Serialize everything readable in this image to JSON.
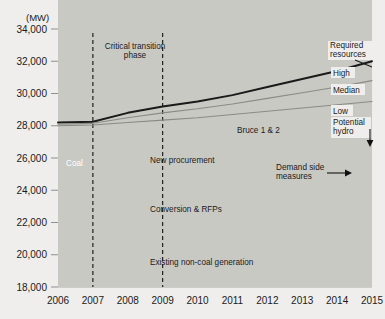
{
  "chart_data": {
    "type": "area",
    "title": "",
    "ylabel": "(MW)",
    "xlabel": "",
    "ylim": [
      18000,
      34000
    ],
    "yticks": [
      18000,
      20000,
      22000,
      24000,
      26000,
      28000,
      30000,
      32000,
      34000
    ],
    "ytick_labels": [
      "18,000",
      "20,000",
      "22,000",
      "24,000",
      "26,000",
      "28,000",
      "30,000",
      "32,000",
      "34,000"
    ],
    "grid": true,
    "legend_position": "inline-annotations",
    "x": [
      2006,
      2007,
      2008,
      2009,
      2010,
      2011,
      2012,
      2013,
      2014,
      2015
    ],
    "xtick_labels": [
      "2006",
      "2007",
      "2008",
      "2009",
      "2010",
      "2011",
      "2012",
      "2013",
      "2014",
      "2015"
    ],
    "stack_order_bottom_to_top": [
      "Existing non-coal generation",
      "Conversion & RFPs",
      "New procurement",
      "Demand side measures",
      "Bruce 1 & 2",
      "Potential hydro",
      "Coal"
    ],
    "series": [
      {
        "name": "Existing non-coal generation",
        "color": "#c9c9c4",
        "values": [
          22100,
          22100,
          22100,
          22100,
          22100,
          22100,
          22100,
          22100,
          21400,
          20900
        ]
      },
      {
        "name": "Conversion & RFPs",
        "color": "#8d8d88",
        "values": [
          0,
          0,
          700,
          2100,
          2900,
          2900,
          2900,
          2900,
          2900,
          2700
        ]
      },
      {
        "name": "New procurement",
        "color": "#f4f3ef",
        "values": [
          0,
          0,
          400,
          1500,
          2100,
          2250,
          2400,
          2500,
          2500,
          2400
        ]
      },
      {
        "name": "Demand side measures",
        "color": "#bdbdb7",
        "values": [
          0,
          100,
          450,
          800,
          1000,
          1100,
          1200,
          1300,
          1450,
          1550
        ]
      },
      {
        "name": "Bruce 1 & 2",
        "color": "#9a9a95",
        "values": [
          0,
          0,
          600,
          1500,
          1500,
          1500,
          1500,
          1500,
          1500,
          1500
        ]
      },
      {
        "name": "Potential hydro",
        "color": "#d5d5d0",
        "values": [
          0,
          0,
          0,
          0,
          0,
          0,
          0,
          0,
          200,
          400
        ]
      },
      {
        "name": "Coal",
        "color": "#6a6a66",
        "values": [
          5900,
          5900,
          4300,
          2200,
          0,
          0,
          0,
          0,
          0,
          0
        ]
      }
    ],
    "lines": [
      {
        "name": "High",
        "color": "#1a1a1a",
        "width": 2.0,
        "values": [
          28200,
          28250,
          28800,
          29200,
          29500,
          29900,
          30400,
          30900,
          31400,
          32000
        ]
      },
      {
        "name": "Median",
        "color": "#8b8b86",
        "width": 1.1,
        "values": [
          28100,
          28150,
          28500,
          28800,
          29050,
          29350,
          29700,
          30050,
          30400,
          30800
        ]
      },
      {
        "name": "Low",
        "color": "#8b8b86",
        "width": 1.1,
        "values": [
          28000,
          28050,
          28200,
          28350,
          28500,
          28700,
          28900,
          29100,
          29300,
          29500
        ]
      }
    ],
    "annotations": [
      {
        "name": "critical-transition-phase",
        "text_line1": "Critical transition",
        "text_line2": "phase",
        "from_x": 2007,
        "to_x": 2009
      },
      {
        "name": "coal",
        "text": "Coal"
      },
      {
        "name": "new-procurement",
        "text": "New procurement"
      },
      {
        "name": "conversion-rfps",
        "text": "Conversion & RFPs"
      },
      {
        "name": "existing-non-coal-generation",
        "text": "Existing non-coal generation"
      },
      {
        "name": "bruce-1-and-2",
        "text": "Bruce 1 & 2"
      },
      {
        "name": "demand-side-measures",
        "text_line1": "Demand side",
        "text_line2": "measures"
      },
      {
        "name": "required-resources",
        "text_line1": "Required",
        "text_line2": "resources"
      },
      {
        "name": "high",
        "text": "High"
      },
      {
        "name": "median",
        "text": "Median"
      },
      {
        "name": "low",
        "text": "Low"
      },
      {
        "name": "potential-hydro",
        "text_line1": "Potential",
        "text_line2": "hydro"
      }
    ]
  },
  "labels": {
    "unit": "(MW)",
    "y": {
      "t34": "34,000",
      "t32": "32,000",
      "t30": "30,000",
      "t28": "28,000",
      "t26": "26,000",
      "t24": "24,000",
      "t22": "22,000",
      "t20": "20,000",
      "t18": "18,000"
    },
    "x": {
      "y2006": "2006",
      "y2007": "2007",
      "y2008": "2008",
      "y2009": "2009",
      "y2010": "2010",
      "y2011": "2011",
      "y2012": "2012",
      "y2013": "2013",
      "y2014": "2014",
      "y2015": "2015"
    },
    "ann": {
      "ctp1": "Critical transition",
      "ctp2": "phase",
      "coal": "Coal",
      "new_proc": "New procurement",
      "conv": "Conversion & RFPs",
      "existing": "Existing non-coal generation",
      "bruce": "Bruce 1 & 2",
      "dsm1": "Demand side",
      "dsm2": "measures",
      "req1": "Required",
      "req2": "resources",
      "high": "High",
      "median": "Median",
      "low": "Low",
      "hydro1": "Potential",
      "hydro2": "hydro"
    }
  },
  "colors": {
    "background": "#efeeec",
    "grid": "#8f8f8f",
    "existing": "#c9c9c4",
    "conversion": "#8d8d88",
    "new_procurement": "#f4f3ef",
    "demand_side": "#bdbdb7",
    "bruce": "#9a9a95",
    "hydro": "#d5d5d0",
    "coal": "#6a6a66",
    "line_high": "#1a1a1a",
    "line_mid": "#8b8b86"
  }
}
